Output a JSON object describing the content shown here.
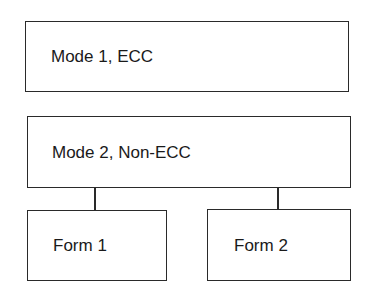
{
  "diagram": {
    "type": "hierarchy",
    "nodes": [
      {
        "id": "mode1",
        "label": "Mode 1, ECC"
      },
      {
        "id": "mode2",
        "label": "Mode 2, Non-ECC"
      },
      {
        "id": "form1",
        "label": "Form 1"
      },
      {
        "id": "form2",
        "label": "Form 2"
      }
    ],
    "edges": [
      {
        "from": "mode2",
        "to": "form1"
      },
      {
        "from": "mode2",
        "to": "form2"
      }
    ],
    "colors": {
      "stroke": "#2a2a2a",
      "fill": "#ffffff",
      "text": "#1a1a1a"
    }
  }
}
